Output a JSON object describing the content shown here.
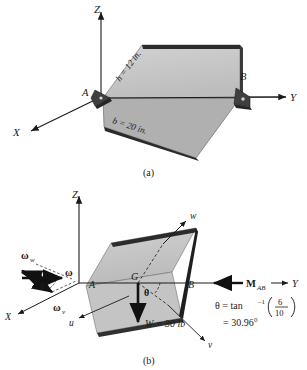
{
  "figure": {
    "type": "engineering-mechanics-diagram",
    "panels": [
      {
        "id": "a",
        "caption": "(a)",
        "axes": {
          "z": "Z",
          "x": "X",
          "y": "Y"
        },
        "points": {
          "a": "A",
          "b": "B"
        },
        "dimensions": [
          {
            "key": "h",
            "label": "h = 12 in.",
            "value": 12,
            "unit": "in."
          },
          {
            "key": "b",
            "label": "b = 20 in.",
            "value": 20,
            "unit": "in."
          }
        ]
      },
      {
        "id": "b",
        "caption": "(b)",
        "axes": {
          "z": "Z",
          "x": "X",
          "y": "Y"
        },
        "body_axes": {
          "u": "u",
          "v": "v",
          "w": "w"
        },
        "points": {
          "a": "A",
          "b": "B",
          "g": "G"
        },
        "vectors": [
          {
            "name": "omega",
            "label": "ω"
          },
          {
            "name": "omega-w",
            "label": "ω",
            "sub": "w"
          },
          {
            "name": "omega-v",
            "label": "ω",
            "sub": "v"
          },
          {
            "name": "weight",
            "label": "W = 30 lb",
            "value": 30,
            "unit": "lb"
          },
          {
            "name": "moment-ab",
            "label": "M",
            "sub": "AB"
          }
        ],
        "angle_symbol": "θ",
        "angle_expression": {
          "line1_lhs": "θ = tan",
          "line1_exp": "–1",
          "fraction_num": "6",
          "fraction_den": "10",
          "line2": "= 30.96°"
        }
      }
    ],
    "colors": {
      "plate_fill": "#c9c9c9",
      "plate_edge_dark": "#2b2b2b",
      "plate_side": "#8f8f8f",
      "bracket": "#3a3a3a",
      "line": "#1a1a1a",
      "background": "#ffffff"
    }
  }
}
